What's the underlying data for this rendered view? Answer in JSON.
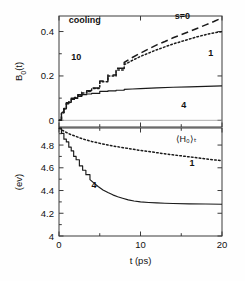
{
  "figure": {
    "background": "#fefefe",
    "ink": "#1a1a1a",
    "panel_label": "cooling"
  },
  "chart_data": [
    {
      "type": "line",
      "panel": "upper",
      "title": "",
      "xlabel": "",
      "ylabel": "B_0(t)",
      "ylabel_display": "B",
      "ylabel_sub": "0",
      "ylabel_tail": "(t)",
      "xlim": [
        0,
        20
      ],
      "ylim": [
        -0.03,
        0.47
      ],
      "grid": false,
      "legend_position": "inline-annotations",
      "xticks": [
        0,
        10,
        20
      ],
      "xtick_labels": [
        "0",
        "10",
        "20"
      ],
      "xminor_ticks": [
        5,
        15
      ],
      "yticks": [
        0,
        0.2,
        0.4
      ],
      "ytick_labels": [
        "0",
        "0.2",
        "0.4"
      ],
      "yminor_ticks": [
        0.1,
        0.3
      ],
      "annotations": [
        {
          "text": "cooling",
          "x": 1.2,
          "y": 0.44,
          "bold": true
        },
        {
          "text": "10",
          "x": 1.5,
          "y": 0.27,
          "bold": true
        },
        {
          "text": "s=0",
          "x": 14.2,
          "y": 0.455,
          "bold": true
        },
        {
          "text": "1",
          "x": 18.3,
          "y": 0.29,
          "bold": true
        },
        {
          "text": "4",
          "x": 15.0,
          "y": 0.055,
          "bold": true
        }
      ],
      "series": [
        {
          "name": "s=0",
          "style": "dashed",
          "label": "s=0",
          "x": [
            0,
            0.3,
            0.6,
            0.9,
            1.2,
            1.5,
            1.9,
            2.3,
            2.8,
            3.4,
            4.0,
            5.0,
            6.0,
            7.0,
            8.0,
            9.0,
            10.0,
            11.0,
            12.0,
            13.0,
            14.0,
            15.0,
            16.0,
            17.0,
            18.0,
            19.0,
            20.0
          ],
          "values": [
            0.0,
            0.035,
            0.055,
            0.075,
            0.085,
            0.095,
            0.105,
            0.115,
            0.125,
            0.135,
            0.15,
            0.175,
            0.205,
            0.235,
            0.26,
            0.283,
            0.303,
            0.322,
            0.34,
            0.355,
            0.372,
            0.386,
            0.4,
            0.415,
            0.43,
            0.445,
            0.462
          ]
        },
        {
          "name": "1",
          "style": "dotted",
          "label": "1",
          "x": [
            0,
            0.3,
            0.6,
            0.9,
            1.2,
            1.5,
            1.9,
            2.3,
            2.8,
            3.4,
            4.0,
            5.0,
            6.0,
            7.0,
            8.0,
            9.0,
            10.0,
            11.0,
            12.0,
            13.0,
            14.0,
            15.0,
            16.0,
            17.0,
            18.0,
            19.0,
            20.0
          ],
          "values": [
            0.0,
            0.033,
            0.053,
            0.072,
            0.082,
            0.092,
            0.102,
            0.112,
            0.122,
            0.132,
            0.147,
            0.172,
            0.2,
            0.228,
            0.25,
            0.27,
            0.288,
            0.303,
            0.318,
            0.331,
            0.344,
            0.355,
            0.366,
            0.377,
            0.386,
            0.394,
            0.4
          ]
        },
        {
          "name": "4",
          "style": "solid",
          "label": "4",
          "x": [
            0,
            0.3,
            0.6,
            0.9,
            1.2,
            1.5,
            1.9,
            2.3,
            2.8,
            3.4,
            4.0,
            5.0,
            6.0,
            7.0,
            8.0,
            9.0,
            10.0,
            12.0,
            14.0,
            16.0,
            18.0,
            20.0
          ],
          "values": [
            0.0,
            0.033,
            0.053,
            0.072,
            0.082,
            0.092,
            0.1,
            0.108,
            0.115,
            0.12,
            0.124,
            0.129,
            0.133,
            0.136,
            0.139,
            0.141,
            0.143,
            0.146,
            0.149,
            0.151,
            0.153,
            0.155
          ]
        }
      ]
    },
    {
      "type": "line",
      "panel": "lower",
      "title": "",
      "xlabel": "t (ps)",
      "ylabel": "(ev)",
      "xlim": [
        0,
        20
      ],
      "ylim": [
        4.0,
        4.95
      ],
      "grid": false,
      "legend_position": "inline-annotations",
      "xticks": [
        0,
        10,
        20
      ],
      "xtick_labels": [
        "0",
        "10",
        "20"
      ],
      "xminor_ticks": [
        5,
        15
      ],
      "yticks": [
        4,
        4.2,
        4.4,
        4.6,
        4.8
      ],
      "ytick_labels": [
        "4",
        "4.2",
        "4.4",
        "4.6",
        "4.8"
      ],
      "yminor_ticks": [
        4.1,
        4.3,
        4.5,
        4.7,
        4.9
      ],
      "annotations": [
        {
          "text": "⟨H₀⟩ₜ",
          "x": 14.3,
          "y": 4.83,
          "bold": false
        },
        {
          "text": "1",
          "x": 16.0,
          "y": 4.62,
          "bold": true
        },
        {
          "text": "4",
          "x": 4.0,
          "y": 4.42,
          "bold": true
        }
      ],
      "series": [
        {
          "name": "1",
          "style": "dotted",
          "label": "1",
          "x": [
            0,
            0.4,
            0.8,
            1.2,
            1.6,
            2.0,
            2.6,
            3.2,
            4.0,
            5.0,
            6.0,
            7.0,
            8.0,
            9.0,
            10.0,
            11.0,
            12.0,
            13.0,
            14.0,
            15.0,
            16.0,
            17.0,
            18.0,
            19.0,
            20.0
          ],
          "values": [
            4.95,
            4.93,
            4.915,
            4.9,
            4.888,
            4.878,
            4.862,
            4.848,
            4.832,
            4.815,
            4.8,
            4.787,
            4.775,
            4.764,
            4.753,
            4.743,
            4.733,
            4.723,
            4.714,
            4.705,
            4.696,
            4.687,
            4.678,
            4.67,
            4.662
          ]
        },
        {
          "name": "4",
          "style": "solid",
          "label": "4",
          "x": [
            0,
            0.3,
            0.6,
            0.9,
            1.2,
            1.5,
            1.8,
            2.1,
            2.5,
            2.9,
            3.3,
            3.8,
            4.3,
            4.8,
            5.4,
            6.0,
            6.6,
            7.2,
            7.8,
            8.5,
            9.2,
            10.0,
            11.0,
            12.0,
            13.0,
            14.0,
            16.0,
            18.0,
            20.0
          ],
          "values": [
            4.95,
            4.9,
            4.855,
            4.82,
            4.785,
            4.74,
            4.7,
            4.665,
            4.62,
            4.578,
            4.54,
            4.5,
            4.465,
            4.435,
            4.405,
            4.382,
            4.362,
            4.345,
            4.332,
            4.318,
            4.308,
            4.3,
            4.295,
            4.291,
            4.288,
            4.286,
            4.283,
            4.281,
            4.279
          ]
        }
      ]
    }
  ]
}
